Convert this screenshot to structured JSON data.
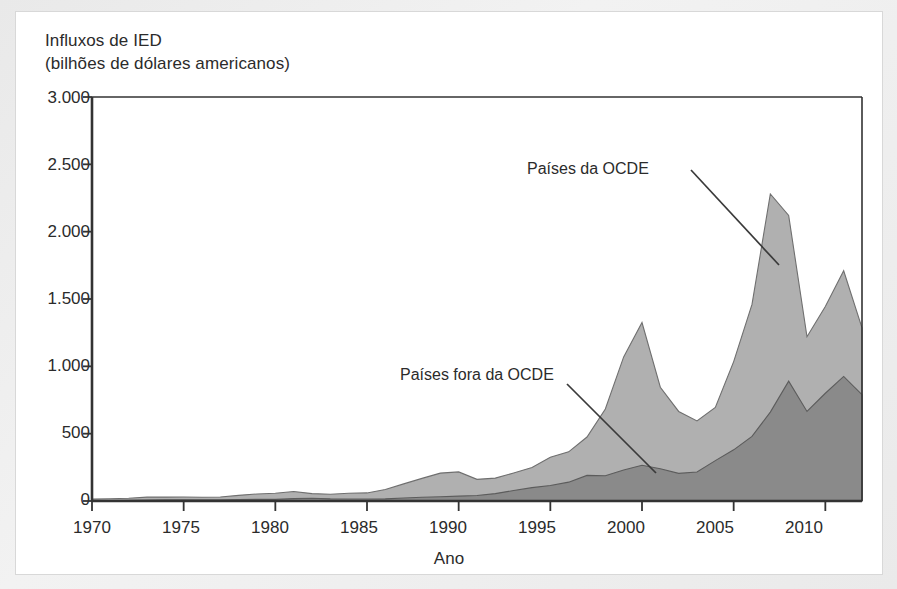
{
  "figure": {
    "background_color": "#eeeeee",
    "panel_color": "#ffffff"
  },
  "axes": {
    "y_title_line1": "Influxos de IED",
    "y_title_line2": "(bilhões de dólares americanos)",
    "x_title": "Ano",
    "y_tick_labels": [
      "3.000",
      "2.500",
      "2.000",
      "1.500",
      "1.000",
      "500",
      "0"
    ],
    "x_tick_labels": [
      "1970",
      "1975",
      "1980",
      "1985",
      "1990",
      "1995",
      "2000",
      "2005",
      "2010"
    ],
    "axis_color": "#333333"
  },
  "annotations": {
    "oecd_label": "Países da OCDE",
    "non_oecd_label": "Países fora da OCDE",
    "leader_line_color": "#3a3a3a"
  },
  "chart_data": {
    "type": "area",
    "stacked": true,
    "title": "Influxos de IED (bilhões de dólares americanos)",
    "xlabel": "Ano",
    "ylabel": "Influxos de IED (bilhões de dólares americanos)",
    "xlim": [
      1970,
      2012
    ],
    "ylim": [
      0,
      3000
    ],
    "ytick_values": [
      0,
      500,
      1000,
      1500,
      2000,
      2500,
      3000
    ],
    "xtick_values": [
      1970,
      1975,
      1980,
      1985,
      1990,
      1995,
      2000,
      2005,
      2010
    ],
    "grid": false,
    "legend_position": "inline-annotation",
    "x": [
      1970,
      1971,
      1972,
      1973,
      1974,
      1975,
      1976,
      1977,
      1978,
      1979,
      1980,
      1981,
      1982,
      1983,
      1984,
      1985,
      1986,
      1987,
      1988,
      1989,
      1990,
      1991,
      1992,
      1993,
      1994,
      1995,
      1996,
      1997,
      1998,
      1999,
      2000,
      2001,
      2002,
      2003,
      2004,
      2005,
      2006,
      2007,
      2008,
      2009,
      2010,
      2011,
      2012
    ],
    "series": [
      {
        "name": "Países fora da OCDE",
        "color": "#8a8a8a",
        "values": [
          3,
          4,
          5,
          7,
          8,
          9,
          8,
          8,
          10,
          12,
          12,
          18,
          20,
          16,
          15,
          15,
          16,
          22,
          28,
          32,
          36,
          41,
          55,
          78,
          99,
          115,
          140,
          190,
          188,
          230,
          265,
          240,
          205,
          215,
          300,
          380,
          480,
          660,
          890,
          665,
          800,
          925,
          790
        ],
        "notes": "Darker lower band of the stack"
      },
      {
        "name": "Países da OCDE",
        "color": "#b0b0b0",
        "values": [
          11,
          13,
          15,
          22,
          21,
          21,
          20,
          22,
          32,
          40,
          45,
          52,
          35,
          34,
          42,
          45,
          70,
          105,
          140,
          175,
          180,
          120,
          115,
          130,
          150,
          210,
          225,
          285,
          495,
          840,
          1060,
          605,
          460,
          380,
          395,
          655,
          980,
          1620,
          1230,
          555,
          645,
          785,
          495
        ],
        "notes": "Lighter upper band stacked on top of non-OECD"
      }
    ],
    "totals": [
      14,
      17,
      20,
      29,
      29,
      30,
      28,
      30,
      42,
      52,
      57,
      70,
      55,
      50,
      57,
      60,
      86,
      127,
      168,
      207,
      216,
      161,
      170,
      208,
      249,
      325,
      365,
      475,
      683,
      1070,
      1325,
      845,
      665,
      595,
      695,
      1035,
      1460,
      2280,
      2120,
      1220,
      1445,
      1710,
      1285
    ],
    "peak_annotations": [
      {
        "year": 2000,
        "total": 1325
      },
      {
        "year": 2007,
        "total": 2280
      },
      {
        "year": 2011,
        "total": 1710
      }
    ]
  }
}
